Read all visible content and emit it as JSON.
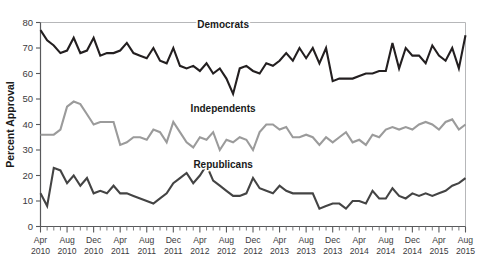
{
  "chart_data": {
    "type": "line",
    "title": "",
    "xlabel": "",
    "ylabel": "Percent Approval",
    "ylim": [
      0,
      80
    ],
    "yticks": [
      0,
      10,
      20,
      30,
      40,
      50,
      60,
      70,
      80
    ],
    "grid": false,
    "legend_position": "inline-annotations",
    "x": [
      "Apr 2010",
      "May 2010",
      "Jun 2010",
      "Jul 2010",
      "Aug 2010",
      "Sep 2010",
      "Oct 2010",
      "Nov 2010",
      "Dec 2010",
      "Jan 2011",
      "Feb 2011",
      "Mar 2011",
      "Apr 2011",
      "May 2011",
      "Jun 2011",
      "Jul 2011",
      "Aug 2011",
      "Sep 2011",
      "Oct 2011",
      "Nov 2011",
      "Dec 2011",
      "Jan 2012",
      "Feb 2012",
      "Mar 2012",
      "Apr 2012",
      "May 2012",
      "Jun 2012",
      "Jul 2012",
      "Aug 2012",
      "Sep 2012",
      "Oct 2012",
      "Nov 2012",
      "Dec 2012",
      "Jan 2013",
      "Feb 2013",
      "Mar 2013",
      "Apr 2013",
      "May 2013",
      "Jun 2013",
      "Jul 2013",
      "Aug 2013",
      "Sep 2013",
      "Oct 2013",
      "Nov 2013",
      "Dec 2013",
      "Jan 2014",
      "Feb 2014",
      "Mar 2014",
      "Apr 2014",
      "May 2014",
      "Jun 2014",
      "Jul 2014",
      "Aug 2014",
      "Sep 2014",
      "Oct 2014",
      "Nov 2014",
      "Dec 2014",
      "Jan 2015",
      "Feb 2015",
      "Mar 2015",
      "Apr 2015",
      "May 2015",
      "Jun 2015",
      "Jul 2015",
      "Aug 2015"
    ],
    "xtick_labels": [
      {
        "month": "Apr",
        "year": "2010",
        "index": 0
      },
      {
        "month": "Aug",
        "year": "2010",
        "index": 4
      },
      {
        "month": "Dec",
        "year": "2010",
        "index": 8
      },
      {
        "month": "Apr",
        "year": "2011",
        "index": 12
      },
      {
        "month": "Aug",
        "year": "2011",
        "index": 16
      },
      {
        "month": "Dec",
        "year": "2011",
        "index": 20
      },
      {
        "month": "Apr",
        "year": "2012",
        "index": 24
      },
      {
        "month": "Aug",
        "year": "2012",
        "index": 28
      },
      {
        "month": "Dec",
        "year": "2012",
        "index": 32
      },
      {
        "month": "Apr",
        "year": "2013",
        "index": 36
      },
      {
        "month": "Aug",
        "year": "2013",
        "index": 40
      },
      {
        "month": "Dec",
        "year": "2013",
        "index": 44
      },
      {
        "month": "Apr",
        "year": "2014",
        "index": 48
      },
      {
        "month": "Aug",
        "year": "2014",
        "index": 52
      },
      {
        "month": "Dec",
        "year": "2014",
        "index": 56
      },
      {
        "month": "Apr",
        "year": "2015",
        "index": 60
      },
      {
        "month": "Aug",
        "year": "2015",
        "index": 64
      }
    ],
    "series": [
      {
        "name": "Democrats",
        "color": "#231f20",
        "width": 2.1,
        "label_x_index": 27.5,
        "label_y": 78,
        "values": [
          77,
          73,
          71,
          68,
          69,
          74,
          68,
          69,
          74,
          67,
          68,
          68,
          69,
          72,
          68,
          67,
          66,
          70,
          65,
          64,
          70,
          63,
          62,
          63,
          61,
          64,
          60,
          62,
          58,
          52,
          62,
          63,
          61,
          60,
          64,
          63,
          65,
          68,
          65,
          70,
          66,
          70,
          64,
          70,
          57,
          58,
          58,
          58,
          59,
          60,
          60,
          61,
          61,
          72,
          62,
          70,
          67,
          67,
          64,
          71,
          67,
          65,
          70,
          62,
          75
        ]
      },
      {
        "name": "Independents",
        "color": "#9b9b9b",
        "width": 2.1,
        "label_x_index": 27.5,
        "label_y": 45,
        "values": [
          36,
          36,
          36,
          38,
          47,
          49,
          48,
          44,
          40,
          41,
          41,
          41,
          32,
          33,
          35,
          35,
          34,
          38,
          37,
          33,
          41,
          37,
          33,
          31,
          35,
          34,
          37,
          30,
          34,
          33,
          35,
          34,
          30,
          37,
          40,
          40,
          38,
          39,
          35,
          35,
          36,
          35,
          32,
          35,
          33,
          35,
          37,
          33,
          34,
          32,
          36,
          35,
          38,
          39,
          38,
          39,
          38,
          40,
          41,
          40,
          38,
          41,
          42,
          38,
          40
        ]
      },
      {
        "name": "Republicans",
        "color": "#444444",
        "width": 2.1,
        "label_x_index": 27.5,
        "label_y": 23,
        "values": [
          13,
          8,
          23,
          22,
          17,
          20,
          16,
          19,
          13,
          14,
          13,
          16,
          13,
          13,
          12,
          11,
          10,
          9,
          11,
          13,
          17,
          19,
          21,
          17,
          20,
          24,
          18,
          16,
          14,
          12,
          12,
          13,
          19,
          15,
          14,
          13,
          16,
          14,
          13,
          13,
          13,
          13,
          7,
          8,
          9,
          9,
          7,
          10,
          10,
          9,
          14,
          11,
          11,
          15,
          12,
          11,
          13,
          12,
          13,
          12,
          13,
          14,
          16,
          17,
          19
        ]
      }
    ]
  },
  "axis": {
    "y_title": "Percent Approval"
  },
  "caption": {
    "text": ""
  }
}
